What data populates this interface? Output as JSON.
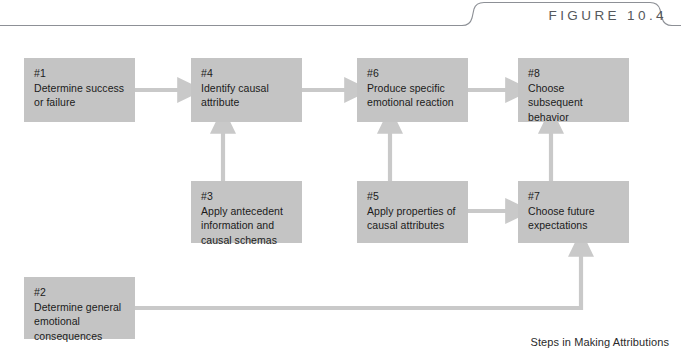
{
  "figure": {
    "label": "FIGURE 10.4",
    "caption": "Steps in Making Attributions",
    "rule_color": "#8d9096",
    "box_fill": "#c4c4c4",
    "arrow_color": "#c9c9c9",
    "text_color": "#1b1b1b"
  },
  "nodes": [
    {
      "id": "#1",
      "text": "Determine success\nor failure",
      "x": 24,
      "y": 58,
      "w": 111,
      "h": 64
    },
    {
      "id": "#4",
      "text": "Identify causal\nattribute",
      "x": 191,
      "y": 58,
      "w": 111,
      "h": 64
    },
    {
      "id": "#6",
      "text": "Produce specific\nemotional reaction",
      "x": 357,
      "y": 58,
      "w": 111,
      "h": 64
    },
    {
      "id": "#8",
      "text": "Choose subsequent\nbehavior",
      "x": 518,
      "y": 58,
      "w": 111,
      "h": 64
    },
    {
      "id": "#3",
      "text": "Apply antecedent\ninformation and\ncausal schemas",
      "x": 191,
      "y": 181,
      "w": 111,
      "h": 62
    },
    {
      "id": "#5",
      "text": "Apply properties of\ncausal attributes",
      "x": 357,
      "y": 181,
      "w": 111,
      "h": 62
    },
    {
      "id": "#7",
      "text": "Choose future\nexpectations",
      "x": 518,
      "y": 181,
      "w": 111,
      "h": 62
    },
    {
      "id": "#2",
      "text": "Determine general\nemotional\nconsequences",
      "x": 24,
      "y": 277,
      "w": 111,
      "h": 62
    }
  ],
  "connections": [
    {
      "from": "#1",
      "to": "#4",
      "kind": "horizontal-right"
    },
    {
      "from": "#4",
      "to": "#6",
      "kind": "horizontal-right"
    },
    {
      "from": "#6",
      "to": "#8",
      "kind": "horizontal-right"
    },
    {
      "from": "#3",
      "to": "#4",
      "kind": "vertical-up"
    },
    {
      "from": "#5",
      "to": "#6",
      "kind": "vertical-up"
    },
    {
      "from": "#7",
      "to": "#8",
      "kind": "vertical-up"
    },
    {
      "from": "#5",
      "to": "#7",
      "kind": "horizontal-right"
    },
    {
      "from": "#2",
      "to": "#7",
      "kind": "elbow-right-up"
    }
  ]
}
